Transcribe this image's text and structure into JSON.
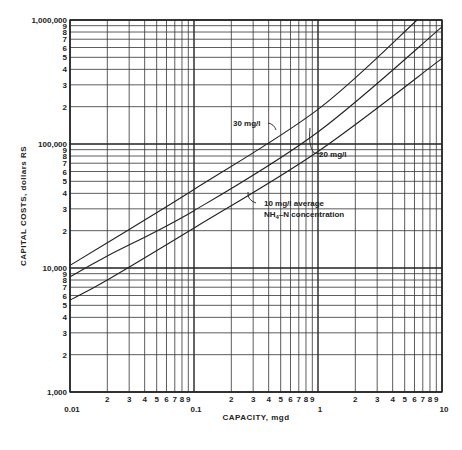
{
  "chart_data": {
    "type": "line",
    "scale": "log-log",
    "title": "",
    "xlabel": "CAPACITY, mgd",
    "ylabel": "CAPITAL COSTS, dollars RS",
    "xlim": [
      0.01,
      10
    ],
    "ylim": [
      1000,
      1000000
    ],
    "grid": true,
    "x_tick_labels": [
      {
        "value": 0.01,
        "label": "0.01",
        "major": true
      },
      {
        "value": 0.02,
        "label": "2"
      },
      {
        "value": 0.03,
        "label": "3"
      },
      {
        "value": 0.04,
        "label": "4"
      },
      {
        "value": 0.05,
        "label": "5"
      },
      {
        "value": 0.06,
        "label": "6"
      },
      {
        "value": 0.07,
        "label": "7"
      },
      {
        "value": 0.08,
        "label": "8"
      },
      {
        "value": 0.09,
        "label": "9"
      },
      {
        "value": 0.1,
        "label": "0.1",
        "major": true
      },
      {
        "value": 0.2,
        "label": "2"
      },
      {
        "value": 0.3,
        "label": "3"
      },
      {
        "value": 0.4,
        "label": "4"
      },
      {
        "value": 0.5,
        "label": "5"
      },
      {
        "value": 0.6,
        "label": "6"
      },
      {
        "value": 0.7,
        "label": "7"
      },
      {
        "value": 0.8,
        "label": "8"
      },
      {
        "value": 0.9,
        "label": "9"
      },
      {
        "value": 1,
        "label": "1",
        "major": true
      },
      {
        "value": 2,
        "label": "2"
      },
      {
        "value": 3,
        "label": "3"
      },
      {
        "value": 4,
        "label": "4"
      },
      {
        "value": 5,
        "label": "5"
      },
      {
        "value": 6,
        "label": "6"
      },
      {
        "value": 7,
        "label": "7"
      },
      {
        "value": 8,
        "label": "8"
      },
      {
        "value": 9,
        "label": "9"
      },
      {
        "value": 10,
        "label": "10",
        "major": true
      }
    ],
    "y_tick_labels": [
      {
        "value": 1000,
        "label": "1,000",
        "major": true
      },
      {
        "value": 2000,
        "label": "2"
      },
      {
        "value": 3000,
        "label": "3"
      },
      {
        "value": 4000,
        "label": "4"
      },
      {
        "value": 5000,
        "label": "5"
      },
      {
        "value": 6000,
        "label": "6"
      },
      {
        "value": 7000,
        "label": "7"
      },
      {
        "value": 8000,
        "label": "8"
      },
      {
        "value": 9000,
        "label": "9"
      },
      {
        "value": 10000,
        "label": "10,000",
        "major": true
      },
      {
        "value": 20000,
        "label": "2"
      },
      {
        "value": 30000,
        "label": "3"
      },
      {
        "value": 40000,
        "label": "4"
      },
      {
        "value": 50000,
        "label": "5"
      },
      {
        "value": 60000,
        "label": "6"
      },
      {
        "value": 70000,
        "label": "7"
      },
      {
        "value": 80000,
        "label": "8"
      },
      {
        "value": 90000,
        "label": "9"
      },
      {
        "value": 100000,
        "label": "100,000",
        "major": true
      },
      {
        "value": 200000,
        "label": "2"
      },
      {
        "value": 300000,
        "label": "3"
      },
      {
        "value": 400000,
        "label": "4"
      },
      {
        "value": 500000,
        "label": "5"
      },
      {
        "value": 600000,
        "label": "6"
      },
      {
        "value": 700000,
        "label": "7"
      },
      {
        "value": 800000,
        "label": "8"
      },
      {
        "value": 900000,
        "label": "9"
      },
      {
        "value": 1000000,
        "label": "1,000,000",
        "major": true
      }
    ],
    "series": [
      {
        "name": "30 mg/l",
        "x": [
          0.01,
          0.02,
          0.1,
          1,
          6.3
        ],
        "y": [
          10500,
          16000,
          43000,
          190000,
          1000000
        ]
      },
      {
        "name": "20 mg/l",
        "x": [
          0.01,
          0.02,
          0.1,
          1,
          10
        ],
        "y": [
          8500,
          12500,
          29000,
          125000,
          880000
        ]
      },
      {
        "name": "10 mg/l average NH4-N concentration",
        "x": [
          0.01,
          0.02,
          0.1,
          1,
          10
        ],
        "y": [
          5500,
          8000,
          21000,
          87000,
          490000
        ]
      }
    ],
    "annotations": [
      {
        "text": "30 mg/l",
        "series": "30 mg/l"
      },
      {
        "text": "20 mg/l",
        "series": "20 mg/l"
      },
      {
        "text_line1": "10 mg/l average",
        "text_line2": "NH4-N concentration",
        "series": "10 mg/l average NH4-N concentration"
      }
    ]
  }
}
